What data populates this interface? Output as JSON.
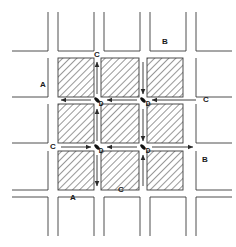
{
  "figure": {
    "canvas": {
      "width": 236,
      "height": 247,
      "background": "#ffffff"
    },
    "style": {
      "line_color": "#3b3b3b",
      "hatch_color": "#4a4a4a",
      "block_fill": "#ffffff",
      "arrow_color": "#2b2b2b",
      "node_color": "#111111",
      "label_color": "#1a1a1a"
    },
    "geometry": {
      "cell_pitch": 46,
      "block_size": 39,
      "street_width": 7,
      "origin_x": 12,
      "origin_y": 12,
      "columns": 5,
      "rows": 5,
      "core_start_col": 1,
      "core_start_row": 1,
      "core_cols": 3,
      "core_rows": 3
    }
  },
  "legend_labels": [
    {
      "id": "label-a-left",
      "text": "A",
      "x": 43,
      "y": 85
    },
    {
      "id": "label-a-bottom",
      "text": "A",
      "x": 73,
      "y": 198
    },
    {
      "id": "label-b-top",
      "text": "B",
      "x": 165,
      "y": 42
    },
    {
      "id": "label-b-right",
      "text": "B",
      "x": 205,
      "y": 160
    },
    {
      "id": "label-c-top",
      "text": "C",
      "x": 97,
      "y": 55
    },
    {
      "id": "label-c-right",
      "text": "C",
      "x": 206,
      "y": 100
    },
    {
      "id": "label-c-left",
      "text": "C",
      "x": 53,
      "y": 147
    },
    {
      "id": "label-c-bottom",
      "text": "C",
      "x": 121,
      "y": 190
    }
  ],
  "node_labels": [
    {
      "id": "node-d-top-left",
      "text": "D",
      "x": 101,
      "y": 104
    },
    {
      "id": "node-d-top-right",
      "text": "D",
      "x": 148,
      "y": 104
    },
    {
      "id": "node-d-bottom-left",
      "text": "D",
      "x": 101,
      "y": 151
    },
    {
      "id": "node-d-bottom-right",
      "text": "D",
      "x": 148,
      "y": 151
    }
  ],
  "intersection_nodes": [
    {
      "id": "node-tl",
      "x": 97,
      "y": 100
    },
    {
      "id": "node-tr",
      "x": 143,
      "y": 100
    },
    {
      "id": "node-bl",
      "x": 97,
      "y": 147
    },
    {
      "id": "node-br",
      "x": 143,
      "y": 147
    }
  ],
  "hatched_blocks": [
    {
      "id": "block-r1c1",
      "x": 58,
      "y": 58,
      "w": 36,
      "h": 39
    },
    {
      "id": "block-r1c2",
      "x": 101,
      "y": 58,
      "w": 38,
      "h": 39
    },
    {
      "id": "block-r1c3",
      "x": 147,
      "y": 58,
      "w": 36,
      "h": 39
    },
    {
      "id": "block-r2c1",
      "x": 58,
      "y": 104,
      "w": 36,
      "h": 39
    },
    {
      "id": "block-r2c2",
      "x": 101,
      "y": 104,
      "w": 38,
      "h": 39
    },
    {
      "id": "block-r2c3",
      "x": 147,
      "y": 104,
      "w": 36,
      "h": 39
    },
    {
      "id": "block-r3c1",
      "x": 58,
      "y": 151,
      "w": 36,
      "h": 39
    },
    {
      "id": "block-r3c2",
      "x": 101,
      "y": 151,
      "w": 38,
      "h": 39
    },
    {
      "id": "block-r3c3",
      "x": 147,
      "y": 151,
      "w": 36,
      "h": 39
    }
  ],
  "outer_blocks": [
    {
      "id": "outer-top-1",
      "x": 12,
      "y": 12,
      "w": 36,
      "h": 39,
      "edges": "bottom-right"
    },
    {
      "id": "outer-top-2",
      "x": 58,
      "y": 12,
      "w": 36,
      "h": 39,
      "edges": "left-bottom-right"
    },
    {
      "id": "outer-top-3",
      "x": 104,
      "y": 12,
      "w": 36,
      "h": 39,
      "edges": "left-bottom-right"
    },
    {
      "id": "outer-top-4",
      "x": 150,
      "y": 12,
      "w": 36,
      "h": 39,
      "edges": "left-bottom-right"
    },
    {
      "id": "outer-top-5",
      "x": 196,
      "y": 12,
      "w": 36,
      "h": 39,
      "edges": "left-bottom"
    },
    {
      "id": "outer-mid1-l",
      "x": 12,
      "y": 58,
      "w": 36,
      "h": 39,
      "edges": "bottom-right"
    },
    {
      "id": "outer-mid1-r",
      "x": 196,
      "y": 58,
      "w": 36,
      "h": 39,
      "edges": "left-bottom"
    },
    {
      "id": "outer-mid2-l",
      "x": 12,
      "y": 104,
      "w": 36,
      "h": 39,
      "edges": "bottom-right"
    },
    {
      "id": "outer-mid2-r",
      "x": 196,
      "y": 104,
      "w": 36,
      "h": 39,
      "edges": "left-bottom"
    },
    {
      "id": "outer-mid3-l",
      "x": 12,
      "y": 151,
      "w": 36,
      "h": 39,
      "edges": "bottom-right"
    },
    {
      "id": "outer-mid3-r",
      "x": 196,
      "y": 151,
      "w": 36,
      "h": 39,
      "edges": "left-bottom"
    },
    {
      "id": "outer-bot-1",
      "x": 12,
      "y": 197,
      "w": 36,
      "h": 39,
      "edges": "top-right"
    },
    {
      "id": "outer-bot-2",
      "x": 58,
      "y": 197,
      "w": 36,
      "h": 39,
      "edges": "left-top-right"
    },
    {
      "id": "outer-bot-3",
      "x": 104,
      "y": 197,
      "w": 36,
      "h": 39,
      "edges": "left-top-right"
    },
    {
      "id": "outer-bot-4",
      "x": 150,
      "y": 197,
      "w": 36,
      "h": 39,
      "edges": "left-top-right"
    },
    {
      "id": "outer-bot-5",
      "x": 196,
      "y": 197,
      "w": 36,
      "h": 39,
      "edges": "left-top"
    }
  ],
  "flow_arrows": [
    {
      "id": "arrow-v1-r1",
      "street": "vertical-left",
      "segment": "row-1",
      "direction": "up",
      "x1": 97,
      "y1": 94,
      "x2": 97,
      "y2": 62
    },
    {
      "id": "arrow-v1-r2",
      "street": "vertical-left",
      "segment": "row-2",
      "direction": "up",
      "x1": 97,
      "y1": 141,
      "x2": 97,
      "y2": 109
    },
    {
      "id": "arrow-v1-r3",
      "street": "vertical-left",
      "segment": "row-3",
      "direction": "down",
      "x1": 97,
      "y1": 155,
      "x2": 97,
      "y2": 186
    },
    {
      "id": "arrow-v2-r1",
      "street": "vertical-right",
      "segment": "row-1",
      "direction": "down",
      "x1": 143,
      "y1": 62,
      "x2": 143,
      "y2": 94
    },
    {
      "id": "arrow-v2-r2",
      "street": "vertical-right",
      "segment": "row-2",
      "direction": "down",
      "x1": 143,
      "y1": 109,
      "x2": 143,
      "y2": 141
    },
    {
      "id": "arrow-v2-r3",
      "street": "vertical-right",
      "segment": "row-3",
      "direction": "up",
      "x1": 143,
      "y1": 186,
      "x2": 143,
      "y2": 155
    },
    {
      "id": "arrow-h1-c1",
      "street": "horizontal-top",
      "segment": "col-1",
      "direction": "left",
      "x1": 91,
      "y1": 100,
      "x2": 61,
      "y2": 100
    },
    {
      "id": "arrow-h1-c2",
      "street": "horizontal-top",
      "segment": "col-2",
      "direction": "left",
      "x1": 137,
      "y1": 100,
      "x2": 107,
      "y2": 100
    },
    {
      "id": "arrow-h1-c3",
      "street": "horizontal-top",
      "segment": "col-3",
      "direction": "left",
      "x1": 196,
      "y1": 100,
      "x2": 152,
      "y2": 100
    },
    {
      "id": "arrow-h2-c1",
      "street": "horizontal-bottom",
      "segment": "col-1",
      "direction": "right",
      "x1": 61,
      "y1": 147,
      "x2": 91,
      "y2": 147
    },
    {
      "id": "arrow-h2-c2",
      "street": "horizontal-bottom",
      "segment": "col-2",
      "direction": "left",
      "x1": 137,
      "y1": 147,
      "x2": 107,
      "y2": 147
    },
    {
      "id": "arrow-h2-c3",
      "street": "horizontal-bottom",
      "segment": "col-3",
      "direction": "right",
      "x1": 152,
      "y1": 147,
      "x2": 193,
      "y2": 147
    }
  ]
}
